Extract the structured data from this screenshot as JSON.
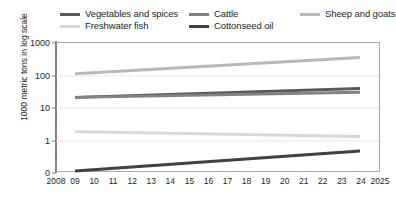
{
  "chart_data": {
    "type": "line",
    "title": "",
    "xlabel": "",
    "ylabel": "1000 metric tons in log scale",
    "y_scale": "log",
    "ytick_labels": [
      "1000",
      "100",
      "10",
      "1",
      "0"
    ],
    "ytick_values": [
      1000,
      100,
      10,
      1,
      0
    ],
    "ylim": [
      0,
      1000
    ],
    "grid": "horizontal-dotted",
    "legend_position": "top",
    "x": [
      2008,
      2009,
      2010,
      2011,
      2012,
      2013,
      2014,
      2015,
      2016,
      2017,
      2018,
      2019,
      2020,
      2021,
      2022,
      2023,
      2024,
      2025
    ],
    "xtick_labels": [
      "2008",
      "09",
      "10",
      "11",
      "12",
      "13",
      "14",
      "15",
      "16",
      "17",
      "18",
      "19",
      "20",
      "21",
      "22",
      "23",
      "24",
      "2025"
    ],
    "series": [
      {
        "name": "Sheep and goats",
        "color": "#b7b9bb",
        "x": [
          2009,
          2024
        ],
        "values": [
          110,
          350
        ]
      },
      {
        "name": "Vegetables and spices",
        "color": "#58595b",
        "x": [
          2009,
          2024
        ],
        "values": [
          20,
          38
        ]
      },
      {
        "name": "Cattle",
        "color": "#808285",
        "x": [
          2009,
          2024
        ],
        "values": [
          20,
          29
        ]
      },
      {
        "name": "Freshwater fish",
        "color": "#d6d7d8",
        "x": [
          2009,
          2024
        ],
        "values": [
          1.7,
          1.2
        ]
      },
      {
        "name": "Cottonseed oil",
        "color": "#414042",
        "x": [
          2009,
          2024
        ],
        "values": [
          0.1,
          0.42
        ]
      }
    ]
  },
  "legend": {
    "entries": [
      {
        "label": "Vegetables and spices",
        "color": "#58595b"
      },
      {
        "label": "Freshwater fish",
        "color": "#d6d7d8"
      },
      {
        "label": "Cattle",
        "color": "#808285"
      },
      {
        "label": "Cottonseed oil",
        "color": "#414042"
      },
      {
        "label": "Sheep and goats",
        "color": "#b7b9bb"
      }
    ]
  },
  "axes": {
    "y_title": "1000 metric tons in log scale"
  }
}
